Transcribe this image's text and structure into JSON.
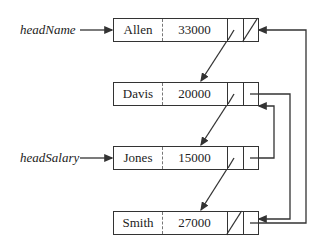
{
  "diagram": {
    "type": "multi-linked-list",
    "heads": [
      {
        "name": "headName",
        "points_to": "Allen"
      },
      {
        "name": "headSalary",
        "points_to": "Jones"
      }
    ],
    "nodes": [
      {
        "name": "Allen",
        "salary": "33000",
        "next_name": "Davis",
        "next_salary": null
      },
      {
        "name": "Davis",
        "salary": "20000",
        "next_name": "Jones",
        "next_salary": "Smith"
      },
      {
        "name": "Jones",
        "salary": "15000",
        "next_name": "Smith",
        "next_salary": "Davis"
      },
      {
        "name": "Smith",
        "salary": "27000",
        "next_name": null,
        "next_salary": "Allen"
      }
    ],
    "colors": {
      "line": "#333333",
      "background": "#ffffff"
    }
  }
}
